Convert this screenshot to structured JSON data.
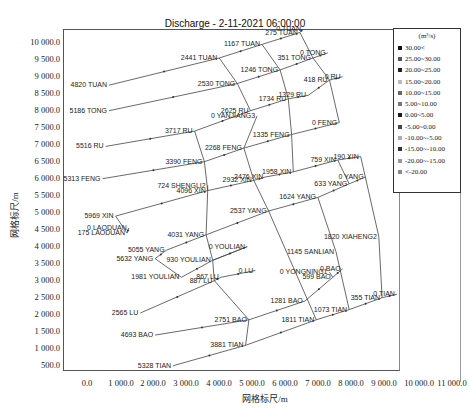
{
  "chart_data": {
    "type": "scatter",
    "subtype": "river-network-schematic",
    "title": "Discharge - 2-11-2021 06:00:00",
    "xlabel": "网格标尺/m",
    "ylabel": "网格标尺/m",
    "xlim": [
      -600,
      11300
    ],
    "ylim": [
      0,
      10400
    ],
    "x_ticks": [
      "0.0",
      "1 000.0",
      "2 000.0",
      "3 000.0",
      "4 000.0",
      "5 000.0",
      "6 000.0",
      "7 000.0",
      "8 000.0",
      "9 000.0",
      "10 000.0",
      "11 000.0"
    ],
    "y_ticks": [
      "10 000.0",
      "9 500.0",
      "9 000.0",
      "8 500.0",
      "8 000.0",
      "7 500.0",
      "7 000.0",
      "6 500.0",
      "6 000.0",
      "5 500.0",
      "5 000.0",
      "4 500.0",
      "4 000.0",
      "3 500.0",
      "3 000.0",
      "2 500.0",
      "2 000.0",
      "1 500.0",
      "1 000.0",
      "500.0"
    ],
    "grid": false,
    "legend": {
      "position": "upper-right",
      "unit": "(m³/s)",
      "entries": [
        "30.00<",
        "25.00~30.00",
        "20.00~25.00",
        "15.00~20.00",
        "10.00~15.00",
        "5.00~10.00",
        "0.00~5.00",
        "-5.00~0.00",
        "-10.00~-5.00",
        "-15.00~-10.00",
        "-20.00~-15.00",
        "<-20.00"
      ]
    },
    "points": [
      {
        "label": "0 TUAN",
        "x": 6600,
        "y": 10350
      },
      {
        "label": "275 TUAN",
        "x": 6500,
        "y": 10250
      },
      {
        "label": "1167 TUAN",
        "x": 5350,
        "y": 9900
      },
      {
        "label": "2441 TUAN",
        "x": 4050,
        "y": 9500
      },
      {
        "label": "4820 TUAN",
        "x": 700,
        "y": 8700
      },
      {
        "label": "0 TONG",
        "x": 7350,
        "y": 9650
      },
      {
        "label": "351 TONG",
        "x": 6900,
        "y": 9500
      },
      {
        "label": "1246 TONG",
        "x": 5900,
        "y": 9150
      },
      {
        "label": "2530 TONG",
        "x": 4600,
        "y": 8750
      },
      {
        "label": "5186 TONG",
        "x": 700,
        "y": 7950
      },
      {
        "label": "0 RU",
        "x": 7800,
        "y": 8950
      },
      {
        "label": "418 RU",
        "x": 7400,
        "y": 8850
      },
      {
        "label": "1329 RU",
        "x": 6750,
        "y": 8400
      },
      {
        "label": "1734 RU",
        "x": 6150,
        "y": 8300
      },
      {
        "label": "2625 RU",
        "x": 5000,
        "y": 7950
      },
      {
        "label": "0 YANJIANG3",
        "x": 5200,
        "y": 7800
      },
      {
        "label": "3717 RU",
        "x": 3300,
        "y": 7350
      },
      {
        "label": "5516 RU",
        "x": 600,
        "y": 6900
      },
      {
        "label": "0 FENG",
        "x": 7700,
        "y": 7600
      },
      {
        "label": "1335 FENG",
        "x": 6250,
        "y": 7250
      },
      {
        "label": "2268 FENG",
        "x": 4800,
        "y": 6850
      },
      {
        "label": "3390 FENG",
        "x": 3600,
        "y": 6450
      },
      {
        "label": "5313 FENG",
        "x": 500,
        "y": 5950
      },
      {
        "label": "190 XIN",
        "x": 8350,
        "y": 6600
      },
      {
        "label": "759 XIN",
        "x": 7650,
        "y": 6500
      },
      {
        "label": "1958 XIN",
        "x": 6300,
        "y": 6150
      },
      {
        "label": "2476 XIN",
        "x": 5450,
        "y": 6000
      },
      {
        "label": "2932 XIN",
        "x": 5100,
        "y": 5900
      },
      {
        "label": "724 SHENGLI2",
        "x": 3700,
        "y": 5750
      },
      {
        "label": "4096 XIN",
        "x": 3700,
        "y": 5600
      },
      {
        "label": "5969 XIN",
        "x": 900,
        "y": 4850
      },
      {
        "label": "0 LAODUAN",
        "x": 1300,
        "y": 4500
      },
      {
        "label": "175 LAODUAN",
        "x": 1250,
        "y": 4350
      },
      {
        "label": "0 YANG",
        "x": 8500,
        "y": 6000
      },
      {
        "label": "633 YANG",
        "x": 8000,
        "y": 5800
      },
      {
        "label": "1624 YANG",
        "x": 7050,
        "y": 5400
      },
      {
        "label": "2537 YANG",
        "x": 5550,
        "y": 5000
      },
      {
        "label": "4031 YANG",
        "x": 3650,
        "y": 4300
      },
      {
        "label": "5055 YANG",
        "x": 2450,
        "y": 3850
      },
      {
        "label": "5632 YANG",
        "x": 2100,
        "y": 3600
      },
      {
        "label": "1820 XIAHENG2",
        "x": 8900,
        "y": 4250
      },
      {
        "label": "1145 SANLIAN",
        "x": 7600,
        "y": 3800
      },
      {
        "label": "0 YOULIAN",
        "x": 4900,
        "y": 3950
      },
      {
        "label": "930 YOULIAN",
        "x": 3850,
        "y": 3550
      },
      {
        "label": "1981 YOULIAN",
        "x": 2900,
        "y": 3050
      },
      {
        "label": "0 LU",
        "x": 5150,
        "y": 3250
      },
      {
        "label": "867 LU",
        "x": 4100,
        "y": 3050
      },
      {
        "label": "887 LU",
        "x": 3900,
        "y": 2950
      },
      {
        "label": "2565 LU",
        "x": 1650,
        "y": 2000
      },
      {
        "label": "0 BAO",
        "x": 7800,
        "y": 3300
      },
      {
        "label": "0 YONGNING1",
        "x": 7400,
        "y": 3200
      },
      {
        "label": "599 BAO",
        "x": 7500,
        "y": 3050
      },
      {
        "label": "1281 BAO",
        "x": 6650,
        "y": 2350
      },
      {
        "label": "2751 BAO",
        "x": 4950,
        "y": 1800
      },
      {
        "label": "4693 BAO",
        "x": 2100,
        "y": 1350
      },
      {
        "label": "0 TIAN",
        "x": 9450,
        "y": 2550
      },
      {
        "label": "355 TIAN",
        "x": 9000,
        "y": 2450
      },
      {
        "label": "1073 TIAN",
        "x": 8000,
        "y": 2100
      },
      {
        "label": "1811 TIAN",
        "x": 7000,
        "y": 1800
      },
      {
        "label": "3881 TIAN",
        "x": 4850,
        "y": 1050
      },
      {
        "label": "5328 TIAN",
        "x": 2650,
        "y": 450
      }
    ]
  },
  "chart": {
    "title": "Discharge - 2-11-2021 06:00:00",
    "xlabel": "网格标尺/m",
    "ylabel": "网格标尺/m",
    "legend_unit": "(m³/s)",
    "legend_entries": [
      "30.00<",
      "25.00~30.00",
      "20.00~25.00",
      "15.00~20.00",
      "10.00~15.00",
      "5.00~10.00",
      "0.00~5.00",
      "-5.00~0.00",
      "-10.00~-5.00",
      "-15.00~-10.00",
      "-20.00~-15.00",
      "<-20.00"
    ],
    "legend_colors": [
      "#111111",
      "#555555",
      "#222222",
      "#bbbbbb",
      "#666666",
      "#777777",
      "#1a1a1a",
      "#444444",
      "#aaaaaa",
      "#333333",
      "#999999",
      "#888888"
    ],
    "x_ticks": [
      "0.0",
      "1 000.0",
      "2 000.0",
      "3 000.0",
      "4 000.0",
      "5 000.0",
      "6 000.0",
      "7 000.0",
      "8 000.0",
      "9 000.0",
      "10 000.0",
      "11 000.0"
    ],
    "y_ticks": [
      "10 000.0",
      "9 500.0",
      "9 000.0",
      "8 500.0",
      "8 000.0",
      "7 500.0",
      "7 000.0",
      "6 500.0",
      "6 000.0",
      "5 500.0",
      "5 000.0",
      "4 500.0",
      "4 000.0",
      "3 500.0",
      "3 000.0",
      "2 500.0",
      "2 000.0",
      "1 500.0",
      "1 000.0",
      "500.0"
    ]
  }
}
